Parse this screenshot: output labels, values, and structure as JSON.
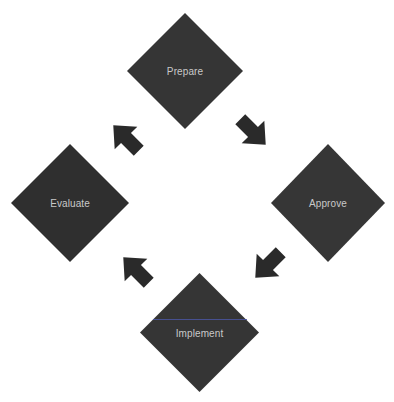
{
  "diagram": {
    "type": "cycle",
    "colors": {
      "node_fill": "#333333",
      "arrow_fill": "#2a2a2a",
      "label_text": "#c9c9c9",
      "background": "#ffffff"
    },
    "nodes": [
      {
        "id": "prepare",
        "label": "Prepare",
        "position": "top"
      },
      {
        "id": "approve",
        "label": "Approve",
        "position": "right"
      },
      {
        "id": "implement",
        "label": "Implement",
        "position": "bottom"
      },
      {
        "id": "evaluate",
        "label": "Evaluate",
        "position": "left"
      }
    ],
    "edges": [
      {
        "from": "prepare",
        "to": "approve",
        "direction": "down-right"
      },
      {
        "from": "approve",
        "to": "implement",
        "direction": "down-left"
      },
      {
        "from": "implement",
        "to": "evaluate",
        "direction": "up-left"
      },
      {
        "from": "evaluate",
        "to": "prepare",
        "direction": "up-right"
      }
    ]
  }
}
